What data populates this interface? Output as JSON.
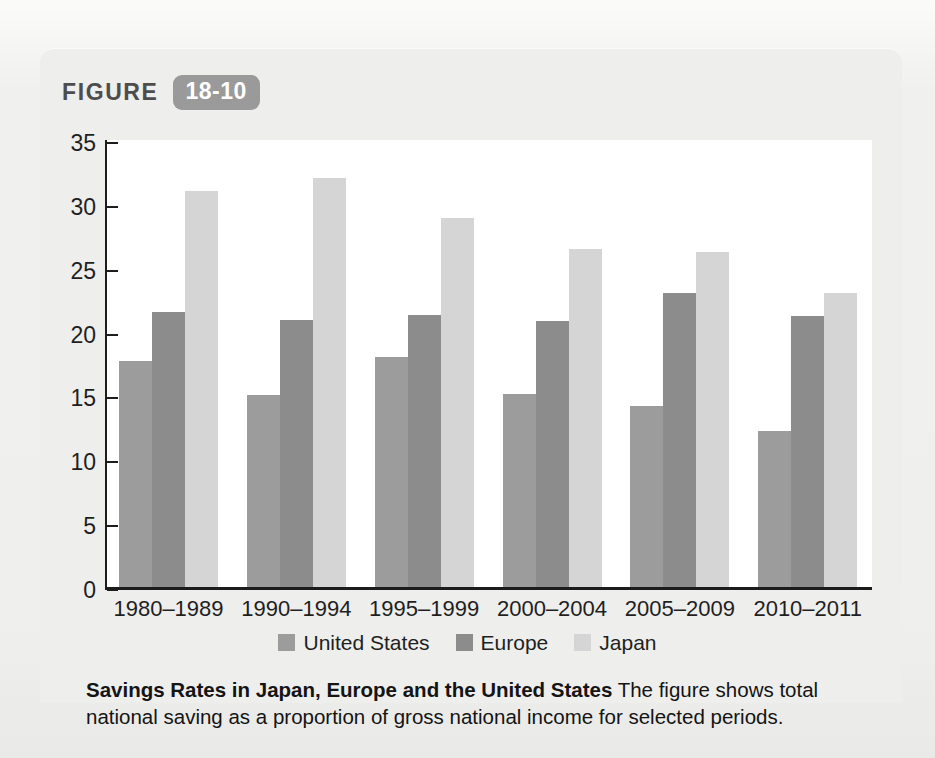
{
  "figure": {
    "label": "FIGURE",
    "number": "18-10"
  },
  "caption": {
    "title": "Savings Rates in Japan, Europe and the United States",
    "body": "The figure shows total national saving as a proportion of gross national income for selected periods."
  },
  "colors": {
    "page_background": "#f1f1ef",
    "panel_background": "#eeeeec",
    "plot_background": "#ffffff",
    "axis": "#1c1c1c",
    "badge": "#9a9a9a",
    "united_states": "#9c9c9c",
    "europe": "#8c8c8c",
    "japan": "#d5d5d5"
  },
  "chart_data": {
    "type": "bar",
    "title": "Savings Rates in Japan, Europe and the United States",
    "xlabel": "",
    "ylabel": "",
    "ylim": [
      0,
      35
    ],
    "yticks": [
      0,
      5,
      10,
      15,
      20,
      25,
      30,
      35
    ],
    "grid": false,
    "legend_position": "bottom",
    "units": "percent of gross national income",
    "categories": [
      "1980–1989",
      "1990–1994",
      "1995–1999",
      "2000–2004",
      "2005–2009",
      "2010–2011"
    ],
    "series": [
      {
        "name": "United States",
        "color": "#9c9c9c",
        "values": [
          17.7,
          15.0,
          18.0,
          15.1,
          14.2,
          12.2
        ]
      },
      {
        "name": "Europe",
        "color": "#8c8c8c",
        "values": [
          21.5,
          20.9,
          21.3,
          20.8,
          23.0,
          21.2
        ]
      },
      {
        "name": "Japan",
        "color": "#d5d5d5",
        "values": [
          31.0,
          32.0,
          28.9,
          26.5,
          26.2,
          23.0
        ]
      }
    ]
  }
}
